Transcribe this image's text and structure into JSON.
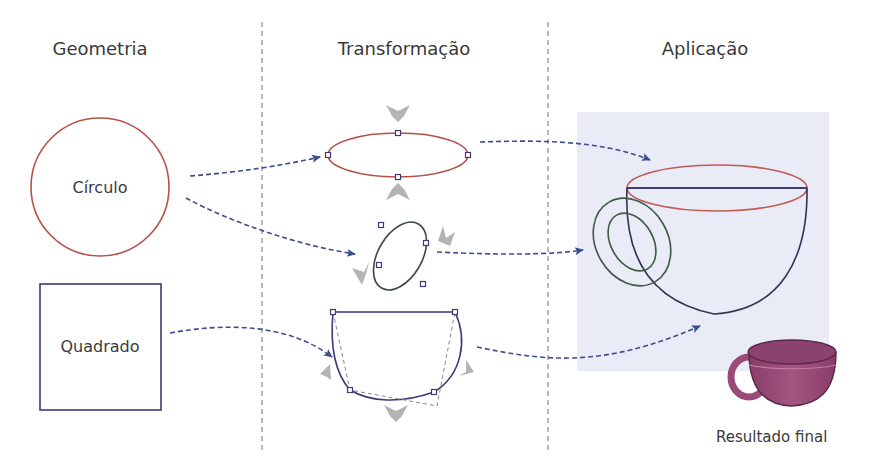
{
  "columns": [
    {
      "title": "Geometria",
      "center_x": 100
    },
    {
      "title": "Transformação",
      "center_x": 404
    },
    {
      "title": "Aplicação",
      "center_x": 705
    }
  ],
  "shapes": {
    "circle_label": "Círculo",
    "square_label": "Quadrado"
  },
  "result": {
    "label": "Resultado final"
  },
  "colors": {
    "red_outline": "#b5504a",
    "navy_outline": "#3c3a78",
    "green_outline": "#3d5a45",
    "arrow_blue": "#3d4d8e",
    "divider": "#8a8a8a",
    "gray_arrow": "#b4b4b4",
    "canvas_bg": "#e9ebf7",
    "cup_fill": "#9a4a78",
    "text": "#3a3a3a"
  },
  "dividers_x": [
    262,
    548
  ]
}
